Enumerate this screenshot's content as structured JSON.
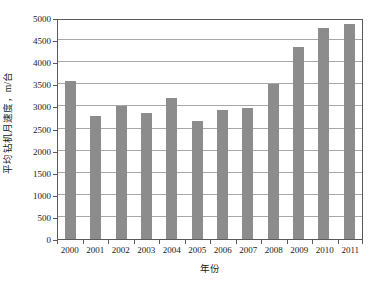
{
  "chart_data": {
    "type": "bar",
    "title": "",
    "subtitle": "",
    "xlabel": "年份",
    "ylabel": "平均钻机月速度，m/台",
    "categories": [
      "2000",
      "2001",
      "2002",
      "2003",
      "2004",
      "2005",
      "2006",
      "2007",
      "2008",
      "2009",
      "2010",
      "2011"
    ],
    "values": [
      3580,
      2790,
      3010,
      2840,
      3180,
      2660,
      2920,
      2965,
      3510,
      4350,
      4770,
      4860
    ],
    "series": [
      {
        "name": "平均钻机月速度",
        "values": [
          3580,
          2790,
          3010,
          2840,
          3180,
          2660,
          2920,
          2965,
          3510,
          4350,
          4770,
          4860
        ]
      }
    ],
    "ylim": [
      0,
      5000
    ],
    "y_ticks": [
      0,
      500,
      1000,
      1500,
      2000,
      2500,
      3000,
      3500,
      4000,
      4500,
      5000
    ],
    "y_tick_labels": [
      "0",
      "500",
      "1000",
      "1500",
      "2000",
      "2500",
      "3000",
      "3500",
      "4000",
      "4500",
      "5000"
    ],
    "grid": "horizontal",
    "legend": "none",
    "bar_color": "#8c8c8c",
    "gridline_color": "#a8a8a8",
    "axis_color": "#5a5a5a",
    "background_color": "#ffffff"
  }
}
